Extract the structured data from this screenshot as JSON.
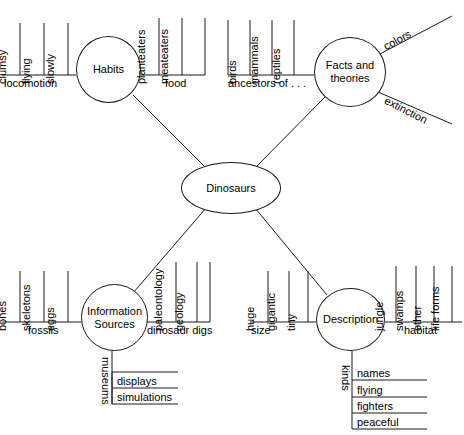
{
  "diagram": {
    "type": "concept-map",
    "center": {
      "label": "Dinosaurs"
    },
    "nodes": [
      {
        "id": "habits",
        "label": "Habits"
      },
      {
        "id": "facts",
        "label": "Facts and theories"
      },
      {
        "id": "info",
        "label": "Information Sources"
      },
      {
        "id": "description",
        "label": "Description"
      }
    ],
    "branches": {
      "habits": {
        "locomotion": {
          "label": "locomotion",
          "items": [
            "clumsy",
            "flying",
            "slowly"
          ]
        },
        "food": {
          "label": "food",
          "items": [
            "planteaters",
            "meateaters"
          ]
        }
      },
      "facts": {
        "ancestors": {
          "label": "ancestors of . . .",
          "items": [
            "birds",
            "mammals",
            "reptiles"
          ]
        },
        "colors": {
          "label": "colors"
        },
        "extinction": {
          "label": "extinction"
        }
      },
      "info": {
        "fossils": {
          "label": "fossils",
          "items": [
            "bones",
            "skeletons",
            "eggs"
          ]
        },
        "digs": {
          "label": "dinosaur digs",
          "items": [
            "paleontology",
            "geology"
          ]
        },
        "museums": {
          "label": "museums",
          "items": [
            "displays",
            "simulations"
          ]
        }
      },
      "description": {
        "size": {
          "label": "size",
          "items": [
            "huge",
            "gigantic",
            "tiny"
          ]
        },
        "habitat": {
          "label": "habitat",
          "items": [
            "jungle",
            "swamps",
            "other",
            "life forms"
          ]
        },
        "kinds": {
          "label": "kinds",
          "items": [
            "names",
            "flying",
            "fighters",
            "peaceful"
          ]
        }
      }
    }
  }
}
